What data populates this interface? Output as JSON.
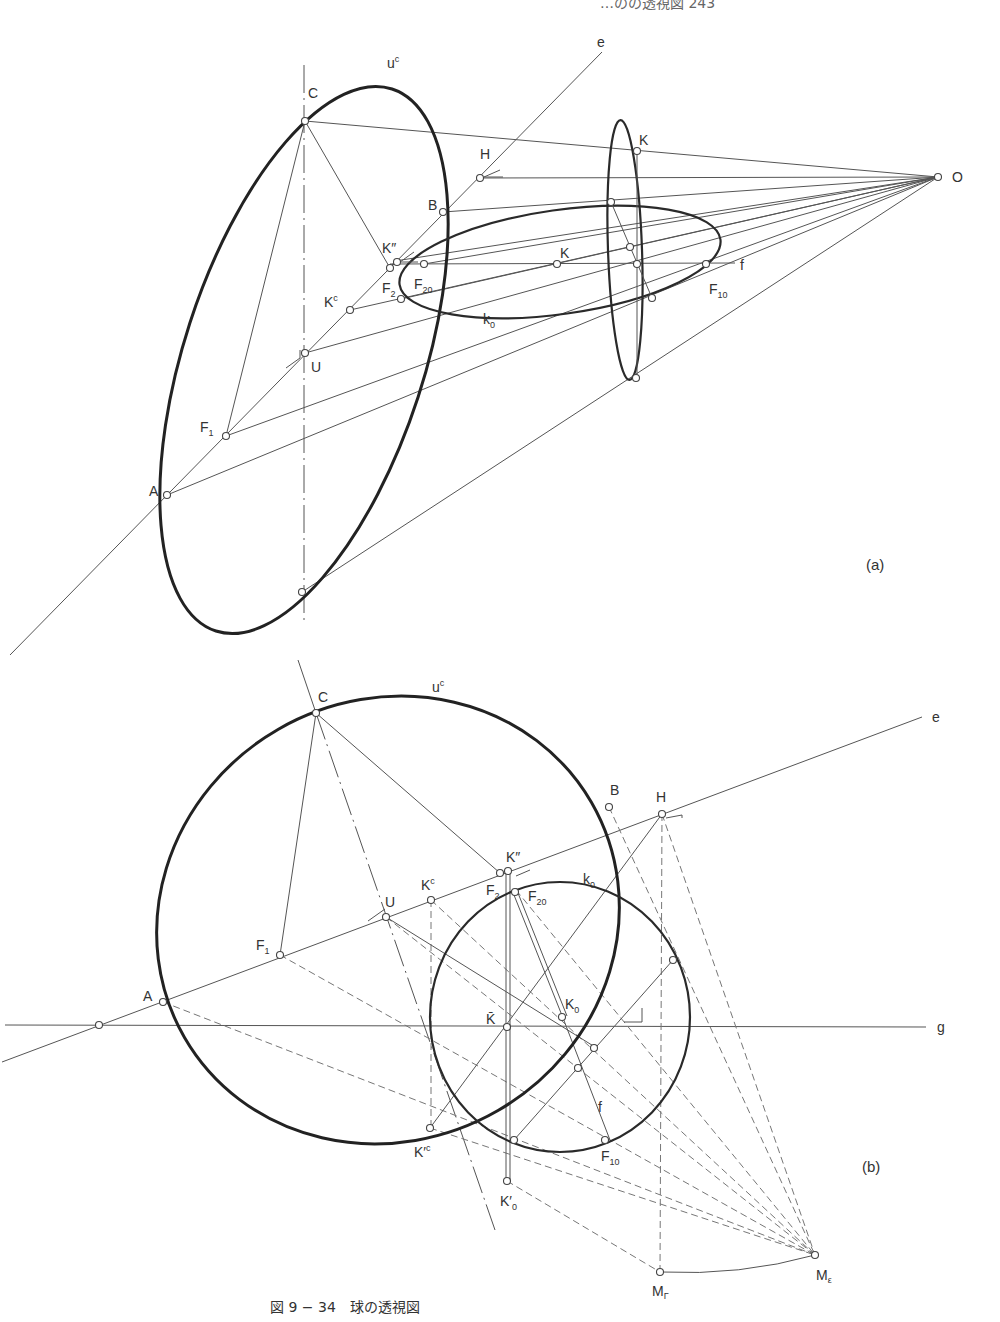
{
  "header": {
    "running_text": "…のの透視図 243"
  },
  "figure": {
    "caption": "図 9 − 34　球の透視図",
    "panels": [
      {
        "id": "a",
        "label": "(a)",
        "points": {
          "C": "C",
          "u_c": "u",
          "u_c_sup": "c",
          "e": "e",
          "H": "H",
          "B": "B",
          "K_top": "K",
          "O": "O",
          "K_dd": "K″",
          "K_mid": "K",
          "f": "f",
          "F2": "F",
          "F2_sub": "2",
          "F20": "F",
          "F20_sub": "20",
          "F10": "F",
          "F10_sub": "10",
          "Kc": "K",
          "Kc_sup": "c",
          "k0": "k",
          "k0_sub": "0",
          "U": "U",
          "F1": "F",
          "F1_sub": "1",
          "A": "A"
        }
      },
      {
        "id": "b",
        "label": "(b)",
        "points": {
          "C": "C",
          "u_c": "u",
          "u_c_sup": "c",
          "e": "e",
          "H": "H",
          "B": "B",
          "K_dd": "K″",
          "k0": "k",
          "k0_sub": "0",
          "Kc": "K",
          "Kc_sup": "c",
          "U": "U",
          "F2": "F",
          "F2_sub": "2",
          "F20": "F",
          "F20_sub": "20",
          "F1": "F",
          "F1_sub": "1",
          "A": "A",
          "K_bar": "K̄",
          "K0": "K",
          "K0_sub": "0",
          "g": "g",
          "f": "f",
          "K_prime_c": "K′",
          "K_prime_c_sup": "c",
          "F10": "F",
          "F10_sub": "10",
          "K0_prime": "K′",
          "K0_prime_sub": "0",
          "M_gamma": "M",
          "M_gamma_sub": "Γ",
          "M_eps": "M",
          "M_eps_sub": "ε"
        }
      }
    ]
  }
}
